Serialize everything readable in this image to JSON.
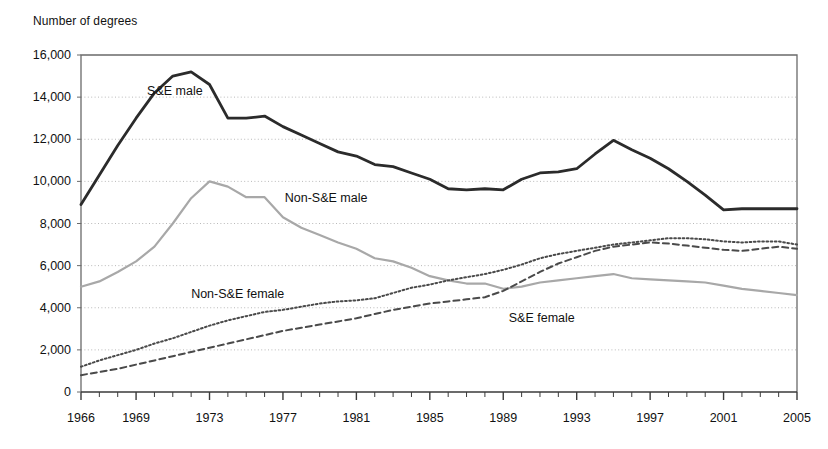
{
  "chart_data": {
    "type": "line",
    "title": "",
    "ylabel": "Number of degrees",
    "xlabel": "",
    "ylim": [
      0,
      16000
    ],
    "xlim": [
      1966,
      2005
    ],
    "grid": true,
    "grid_axis": "y",
    "legend_position": "inline-annotations",
    "y_ticks": [
      "0",
      "2,000",
      "4,000",
      "6,000",
      "8,000",
      "10,000",
      "12,000",
      "14,000",
      "16,000"
    ],
    "y_tick_values": [
      0,
      2000,
      4000,
      6000,
      8000,
      10000,
      12000,
      14000,
      16000
    ],
    "x_ticks": [
      "1966",
      "1969",
      "1973",
      "1977",
      "1981",
      "1985",
      "1989",
      "1993",
      "1997",
      "2001",
      "2005"
    ],
    "x_tick_values": [
      1966,
      1969,
      1973,
      1977,
      1981,
      1985,
      1989,
      1993,
      1997,
      2001,
      2005
    ],
    "x": [
      1966,
      1967,
      1968,
      1969,
      1970,
      1971,
      1972,
      1973,
      1974,
      1975,
      1976,
      1977,
      1978,
      1979,
      1980,
      1981,
      1982,
      1983,
      1984,
      1985,
      1986,
      1987,
      1988,
      1989,
      1990,
      1991,
      1992,
      1993,
      1994,
      1995,
      1996,
      1997,
      1998,
      1999,
      2000,
      2001,
      2002,
      2003,
      2004,
      2005
    ],
    "series": [
      {
        "name": "S&E male",
        "style": "solid",
        "color": "#2b2b2b",
        "width": 2.8,
        "label_x": 1969.6,
        "label_y": 14250,
        "values": [
          8900,
          10300,
          11700,
          13000,
          14200,
          15000,
          15200,
          14600,
          13000,
          13000,
          13100,
          12600,
          12200,
          11800,
          11400,
          11200,
          10800,
          10700,
          10400,
          10100,
          9650,
          9600,
          9650,
          9600,
          10100,
          10400,
          10450,
          10600,
          11300,
          11950,
          11500,
          11100,
          10600,
          10000,
          9350,
          8650,
          8700,
          8700,
          8700,
          8700
        ]
      },
      {
        "name": "Non-S&E male",
        "style": "solid",
        "color": "#a8a8a8",
        "width": 2.2,
        "label_x": 1977.1,
        "label_y": 9150,
        "values": [
          5000,
          5250,
          5700,
          6200,
          6900,
          8000,
          9200,
          10000,
          9750,
          9250,
          9250,
          8300,
          7800,
          7450,
          7100,
          6800,
          6350,
          6200,
          5900,
          5500,
          5300,
          5150,
          5150,
          4900,
          5000,
          5200,
          5300,
          5400,
          5500,
          5600,
          5400,
          5350,
          5300,
          5250,
          5200,
          5050,
          4900,
          4800,
          4700,
          4600
        ]
      },
      {
        "name": "Non-S&E female",
        "style": "dotted",
        "color": "#4a4a4a",
        "width": 2.0,
        "label_x": 1972.0,
        "label_y": 4600,
        "values": [
          1200,
          1500,
          1750,
          2000,
          2300,
          2550,
          2850,
          3150,
          3400,
          3600,
          3800,
          3900,
          4050,
          4200,
          4300,
          4350,
          4450,
          4700,
          4950,
          5100,
          5300,
          5450,
          5600,
          5800,
          6050,
          6350,
          6550,
          6700,
          6850,
          7000,
          7100,
          7200,
          7300,
          7300,
          7250,
          7150,
          7100,
          7150,
          7150,
          7000
        ]
      },
      {
        "name": "S&E female",
        "style": "dashed",
        "color": "#4a4a4a",
        "width": 2.0,
        "label_x": 1989.3,
        "label_y": 3450,
        "values": [
          800,
          950,
          1100,
          1300,
          1500,
          1700,
          1900,
          2100,
          2300,
          2500,
          2700,
          2900,
          3050,
          3200,
          3350,
          3500,
          3700,
          3900,
          4050,
          4200,
          4300,
          4400,
          4500,
          4800,
          5250,
          5700,
          6100,
          6400,
          6700,
          6900,
          7000,
          7100,
          7050,
          6950,
          6850,
          6750,
          6700,
          6800,
          6900,
          6800
        ]
      }
    ]
  }
}
